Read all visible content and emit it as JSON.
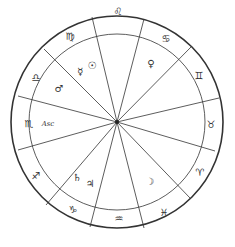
{
  "chart": {
    "center": [
      117,
      122
    ],
    "outer_radius": 106,
    "inner_radius": 88,
    "line_color": "#333333",
    "spoke_endpoints": [
      [
        92,
        17
      ],
      [
        144,
        19
      ],
      [
        191,
        47
      ],
      [
        219,
        98
      ],
      [
        215,
        151
      ],
      [
        190,
        198
      ],
      [
        144,
        228
      ],
      [
        90,
        227
      ],
      [
        46,
        205
      ],
      [
        18,
        150
      ],
      [
        18,
        96
      ],
      [
        44,
        49
      ]
    ],
    "signs": [
      {
        "name": "leo",
        "glyph": "♌",
        "pos": [
          118,
          11
        ]
      },
      {
        "name": "cancer",
        "glyph": "♋",
        "pos": [
          166,
          38
        ]
      },
      {
        "name": "gemini",
        "glyph": "♊",
        "pos": [
          199,
          75
        ]
      },
      {
        "name": "taurus",
        "glyph": "♉",
        "pos": [
          211,
          124
        ]
      },
      {
        "name": "aries",
        "glyph": "♈",
        "pos": [
          200,
          172
        ]
      },
      {
        "name": "pisces",
        "glyph": "♓",
        "pos": [
          164,
          212
        ]
      },
      {
        "name": "aquarius",
        "glyph": "♒",
        "pos": [
          119,
          218
        ]
      },
      {
        "name": "capricorn",
        "glyph": "♑",
        "pos": [
          73,
          209
        ]
      },
      {
        "name": "sagittarius",
        "glyph": "♐",
        "pos": [
          36,
          175
        ]
      },
      {
        "name": "scorpio",
        "glyph": "♏",
        "pos": [
          29,
          123
        ]
      },
      {
        "name": "libra",
        "glyph": "♎",
        "pos": [
          36,
          77
        ]
      },
      {
        "name": "virgo",
        "glyph": "♍",
        "pos": [
          70,
          36
        ]
      }
    ],
    "planets": [
      {
        "name": "sun",
        "glyph": "☉",
        "pos": [
          92,
          65
        ]
      },
      {
        "name": "mercury",
        "glyph": "☿",
        "pos": [
          80,
          71
        ]
      },
      {
        "name": "mars",
        "glyph": "♂",
        "pos": [
          59,
          88
        ]
      },
      {
        "name": "venus",
        "glyph": "♀",
        "pos": [
          151,
          63
        ]
      },
      {
        "name": "saturn",
        "glyph": "♄",
        "pos": [
          77,
          177
        ]
      },
      {
        "name": "jupiter",
        "glyph": "♃",
        "pos": [
          90,
          183
        ]
      },
      {
        "name": "moon",
        "glyph": "☽",
        "pos": [
          150,
          181
        ]
      }
    ],
    "ascendant": {
      "label": "Asc",
      "pos": [
        48,
        124
      ]
    }
  },
  "caption": ""
}
